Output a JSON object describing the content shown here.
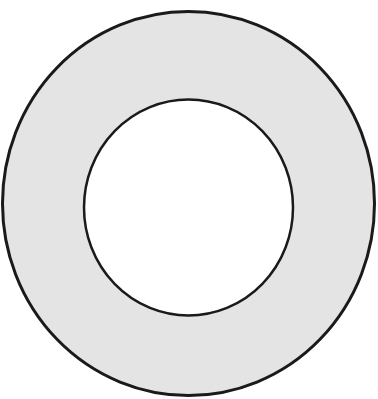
{
  "canvas": {
    "width": 378,
    "height": 399,
    "background": "#ffffff"
  },
  "ring": {
    "outer": {
      "cx": 188.5,
      "cy": 203.5,
      "rx": 186,
      "ry": 192
    },
    "inner": {
      "cx": 188.5,
      "cy": 207.5,
      "rx": 104.5,
      "ry": 108
    },
    "fill": "#e4e4e4",
    "hole_fill": "#ffffff",
    "stroke": "#1a1a1a",
    "outer_stroke_width": 3,
    "inner_stroke_width": 2.5
  }
}
